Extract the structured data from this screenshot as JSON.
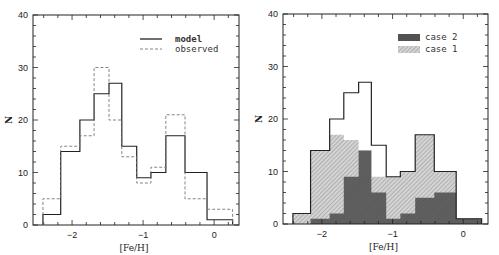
{
  "chart_data": [
    {
      "type": "bar",
      "subtype": "step-histogram",
      "title": "",
      "xlabel": "[Fe/H]",
      "ylabel": "N",
      "xlim": [
        -2.55,
        0.35
      ],
      "ylim": [
        0,
        40
      ],
      "xticks": [
        -2,
        -1,
        0
      ],
      "yticks": [
        0,
        10,
        20,
        30,
        40
      ],
      "grid": false,
      "legend_position": "upper right",
      "bin_edges": [
        -2.41,
        -2.16,
        -1.89,
        -1.69,
        -1.48,
        -1.3,
        -1.09,
        -0.89,
        -0.68,
        -0.41,
        -0.1,
        0.26
      ],
      "series": [
        {
          "name": "model",
          "style": "solid",
          "values": [
            2,
            14,
            20,
            25,
            27,
            15,
            9,
            10,
            17,
            10,
            1
          ]
        },
        {
          "name": "observed",
          "style": "dashed",
          "values": [
            5,
            15,
            17,
            30,
            20,
            13,
            8,
            11,
            21,
            5,
            3
          ]
        }
      ]
    },
    {
      "type": "bar",
      "subtype": "step-histogram-filled",
      "title": "",
      "xlabel": "[Fe/H]",
      "ylabel": "N",
      "xlim": [
        -2.55,
        0.35
      ],
      "ylim": [
        0,
        40
      ],
      "xticks": [
        -2,
        -1,
        0
      ],
      "yticks": [
        0,
        10,
        20,
        30,
        40
      ],
      "grid": false,
      "legend_position": "upper right",
      "bin_edges": [
        -2.41,
        -2.16,
        -1.89,
        -1.69,
        -1.48,
        -1.3,
        -1.09,
        -0.89,
        -0.68,
        -0.41,
        -0.1,
        0.26
      ],
      "series": [
        {
          "name": "model",
          "style": "outline",
          "values": [
            2,
            14,
            20,
            25,
            27,
            15,
            9,
            10,
            17,
            10,
            1
          ]
        },
        {
          "name": "case 1",
          "style": "light-hatch",
          "values": [
            2,
            14,
            17,
            16,
            14,
            9,
            9,
            10,
            17,
            10,
            1
          ]
        },
        {
          "name": "case 2",
          "style": "dark-hatch",
          "values": [
            0,
            1,
            2,
            9,
            14,
            6,
            1,
            2,
            5,
            6,
            1
          ]
        }
      ]
    }
  ],
  "panels": {
    "left": {
      "legend": [
        {
          "label": "model",
          "style": "solid"
        },
        {
          "label": "observed",
          "style": "dashed"
        }
      ],
      "xlabel": "[Fe/H]",
      "ylabel": "N",
      "yticks": [
        "0",
        "10",
        "20",
        "30",
        "40"
      ],
      "xticks": [
        "-2",
        "-1",
        "0"
      ]
    },
    "right": {
      "legend": [
        {
          "label": "case 2",
          "style": "dark-hatch"
        },
        {
          "label": "case 1",
          "style": "light-hatch"
        }
      ],
      "xlabel": "[Fe/H]",
      "ylabel": "N",
      "yticks": [
        "0",
        "10",
        "20",
        "30",
        "40"
      ],
      "xticks": [
        "-2",
        "-1",
        "0"
      ]
    }
  }
}
